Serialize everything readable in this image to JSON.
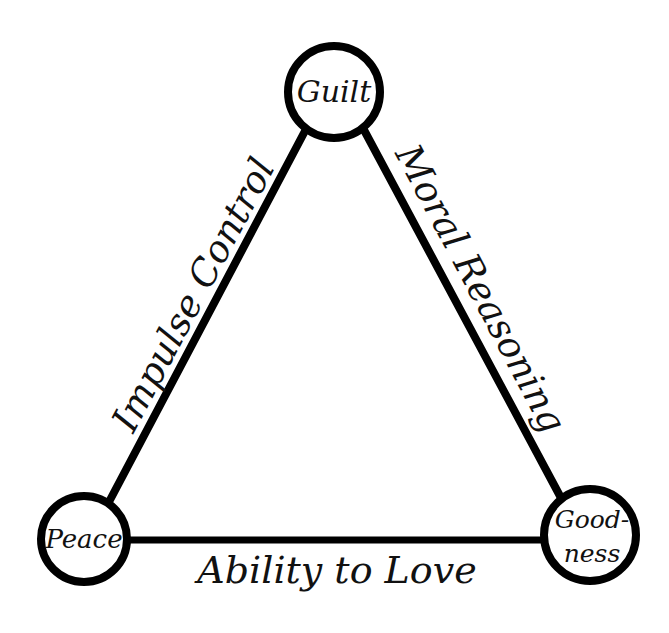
{
  "diagram": {
    "type": "triangle-relationship-diagram",
    "background_color": "#ffffff",
    "stroke_color": "#000000",
    "text_color": "#111111",
    "nodes": [
      {
        "id": "guilt",
        "label": "Guilt",
        "label_lines": [
          "Guilt"
        ],
        "position": "top",
        "cx": 334,
        "cy": 92,
        "r": 46
      },
      {
        "id": "peace",
        "label": "Peace",
        "label_lines": [
          "Peace"
        ],
        "position": "bottom-left",
        "cx": 84,
        "cy": 539,
        "r": 43
      },
      {
        "id": "goodness",
        "label": "Good-ness",
        "label_lines": [
          "Good-",
          "ness"
        ],
        "position": "bottom-right",
        "cx": 590,
        "cy": 535,
        "r": 46
      }
    ],
    "edges": [
      {
        "id": "impulse-control",
        "label": "Impulse Control",
        "from": "peace",
        "to": "guilt",
        "side": "left",
        "rotation_deg": -62
      },
      {
        "id": "moral-reasoning",
        "label": "Moral Reasoning",
        "from": "guilt",
        "to": "goodness",
        "side": "right",
        "rotation_deg": 62
      },
      {
        "id": "ability-to-love",
        "label": "Ability to Love",
        "from": "peace",
        "to": "goodness",
        "side": "bottom",
        "rotation_deg": 0
      }
    ]
  }
}
